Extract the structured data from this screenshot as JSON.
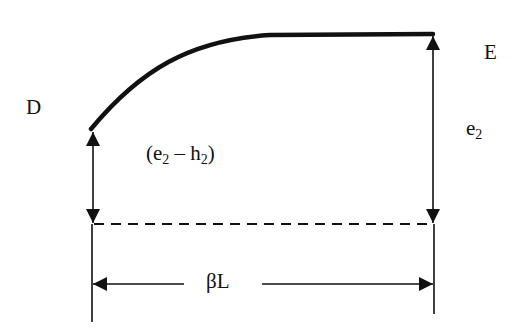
{
  "diagram": {
    "point_left": "D",
    "point_right": "E",
    "left_height_label": {
      "pre": "(e",
      "sub1": "2",
      "mid": " – h",
      "sub2": "2",
      "post": ")"
    },
    "right_height_label": {
      "base": "e",
      "sub": "2"
    },
    "span_label": "βL",
    "colors": {
      "line": "#111111",
      "background": "#ffffff"
    }
  }
}
